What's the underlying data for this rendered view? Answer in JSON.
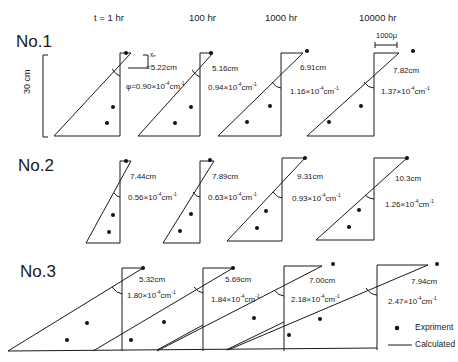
{
  "header": {
    "times": [
      "t = 1 hr",
      "100 hr",
      "1000 hr",
      "10000 hr"
    ]
  },
  "scale": {
    "vertical": "30 cm",
    "horizontal": "1000μ"
  },
  "rows": [
    {
      "title": "No.1",
      "panels": [
        {
          "xe": "5.22cm",
          "xe_label": "xₑ",
          "xe_prefix": "=",
          "phi": "φ=0.90×10",
          "exp": "-4",
          "unit": "cm",
          "unit_exp": "-1"
        },
        {
          "xe": "5.16cm",
          "phi": "0.94×10",
          "exp": "-4",
          "unit": "cm",
          "unit_exp": "-1"
        },
        {
          "xe": "6.91cm",
          "phi": "1.16×10",
          "exp": "-4",
          "unit": "cm",
          "unit_exp": "-1"
        },
        {
          "xe": "7.82cm",
          "phi": "1.37×10",
          "exp": "-4",
          "unit": "cm",
          "unit_exp": "-1"
        }
      ]
    },
    {
      "title": "No.2",
      "panels": [
        {
          "xe": "7.44cm",
          "phi": "0.56×10",
          "exp": "-4",
          "unit": "cm",
          "unit_exp": "-1"
        },
        {
          "xe": "7.89cm",
          "phi": "0.63×10",
          "exp": "-4",
          "unit": "cm",
          "unit_exp": "-1"
        },
        {
          "xe": "9.31cm",
          "phi": "0.93×10",
          "exp": "-4",
          "unit": "cm",
          "unit_exp": "-1"
        },
        {
          "xe": "10.3cm",
          "phi": "1.26×10",
          "exp": "-4",
          "unit": "cm",
          "unit_exp": "-1"
        }
      ]
    },
    {
      "title": "No.3",
      "panels": [
        {
          "xe": "5.32cm",
          "phi": "1.80×10",
          "exp": "-4",
          "unit": "cm",
          "unit_exp": "-1"
        },
        {
          "xe": "5.69cm",
          "phi": "1.84×10",
          "exp": "-4",
          "unit": "cm",
          "unit_exp": "-1"
        },
        {
          "xe": "7.00cm",
          "phi": "2.18×10",
          "exp": "-4",
          "unit": "cm",
          "unit_exp": "-1"
        },
        {
          "xe": "7.94cm",
          "phi": "2.47×10",
          "exp": "-4",
          "unit": "cm",
          "unit_exp": "-1"
        }
      ]
    }
  ],
  "legend": {
    "experiment": "Expriment",
    "calculated": "Calculated"
  },
  "colors": {
    "line": "#1a1a1a",
    "background": "#ffffff"
  }
}
